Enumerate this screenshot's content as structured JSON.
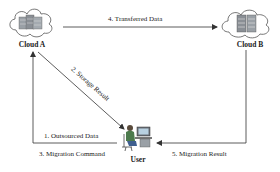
{
  "diagram": {
    "nodes": {
      "cloud_a": {
        "label": "Cloud A"
      },
      "cloud_b": {
        "label": "Cloud B"
      },
      "user": {
        "label": "User"
      }
    },
    "edges": [
      {
        "id": "e1",
        "label": "1. Outsourced Data",
        "from": "User",
        "to": "Cloud A"
      },
      {
        "id": "e2",
        "label": "2. Storage Result",
        "from": "Cloud A",
        "to": "User"
      },
      {
        "id": "e3",
        "label": "3. Migration Command",
        "from": "User",
        "to": "Cloud A"
      },
      {
        "id": "e4",
        "label": "4. Transferred Data",
        "from": "Cloud A",
        "to": "Cloud B"
      },
      {
        "id": "e5",
        "label": "5. Migration Result",
        "from": "Cloud B",
        "to": "User"
      }
    ],
    "colors": {
      "line": "#333333",
      "cloud_outline": "#555555",
      "server": "#8a8f95",
      "text": "#222222"
    }
  }
}
